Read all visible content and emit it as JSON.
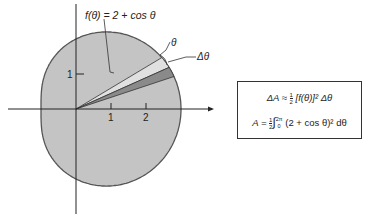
{
  "figure": {
    "curve_label": "f(θ) = 2 + cos θ",
    "theta_label": "θ",
    "delta_theta_label": "Δθ",
    "y_tick_label": "1",
    "x_tick_labels": [
      "1",
      "2"
    ],
    "colors": {
      "region_fill": "#c4c4c4",
      "light_wedge": "#dcdcdc",
      "dark_wedge": "#8c8c8c",
      "outline": "#555555",
      "axis": "#222222"
    }
  },
  "formula_box": {
    "line1": {
      "lhs": "ΔA ≈",
      "frac_num": "1",
      "frac_den": "2",
      "rhs": "[f(θ)]² Δθ"
    },
    "line2": {
      "lhs": "A =",
      "frac_num": "1",
      "frac_den": "2",
      "integral": "∫",
      "upper": "2π",
      "lower": "0",
      "rhs": "(2 + cos θ)² dθ"
    }
  }
}
